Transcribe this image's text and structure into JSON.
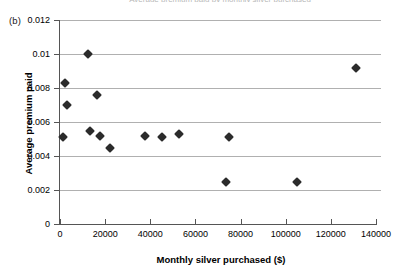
{
  "figure": {
    "panel_label": "(b)",
    "clipped_title": "Average premium paid by monthly silver purchased"
  },
  "chart_data": {
    "type": "scatter",
    "title": "",
    "xlabel": "Monthly silver purchased ($)",
    "ylabel": "Average premium paid",
    "xlim": [
      0,
      140000
    ],
    "ylim": [
      0,
      0.012
    ],
    "xticks": [
      0,
      20000,
      40000,
      60000,
      80000,
      100000,
      120000,
      140000
    ],
    "xtick_labels": [
      "0",
      "20000",
      "40000",
      "60000",
      "80000",
      "100000",
      "120000",
      "140000"
    ],
    "yticks": [
      0,
      0.002,
      0.004,
      0.006,
      0.008,
      0.01,
      0.012
    ],
    "ytick_labels": [
      "0",
      "0.002",
      "0.004",
      "0.006",
      "0.008",
      "0.01",
      "0.012"
    ],
    "grid": "horizontal",
    "legend": "none",
    "marker": "filled-diamond",
    "marker_color": "#2b2b2b",
    "points": [
      {
        "x": 1500,
        "y": 0.0051
      },
      {
        "x": 2200,
        "y": 0.0083
      },
      {
        "x": 3000,
        "y": 0.007
      },
      {
        "x": 12500,
        "y": 0.01
      },
      {
        "x": 13500,
        "y": 0.0055
      },
      {
        "x": 16500,
        "y": 0.0076
      },
      {
        "x": 17500,
        "y": 0.0052
      },
      {
        "x": 22000,
        "y": 0.0045
      },
      {
        "x": 37500,
        "y": 0.0052
      },
      {
        "x": 45000,
        "y": 0.0051
      },
      {
        "x": 52500,
        "y": 0.0053
      },
      {
        "x": 73500,
        "y": 0.0025
      },
      {
        "x": 75000,
        "y": 0.0051
      },
      {
        "x": 105000,
        "y": 0.0025
      },
      {
        "x": 131000,
        "y": 0.0092
      }
    ]
  }
}
